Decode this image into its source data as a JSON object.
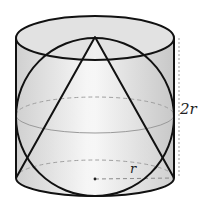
{
  "diagram": {
    "labels": {
      "height": "2r",
      "radius": "r"
    },
    "shapes": [
      "cylinder",
      "sphere",
      "cone"
    ],
    "colors": {
      "stroke": "#111111",
      "fill_light": "#f2f2f2",
      "fill_dark": "#cfcfcf",
      "dashed": "#999999"
    }
  }
}
